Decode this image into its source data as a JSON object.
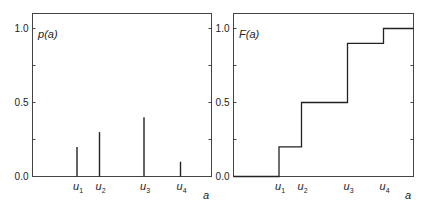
{
  "chart_data": [
    {
      "type": "bar",
      "subtype": "stem",
      "title": "",
      "function_label": "p(a)",
      "xlabel": "a",
      "ylabel": "",
      "ylim": [
        0,
        1.0
      ],
      "yticks": [
        "0.0",
        "0.5",
        "1.0"
      ],
      "categories": [
        "u1",
        "u2",
        "u3",
        "u4"
      ],
      "values": [
        0.2,
        0.3,
        0.4,
        0.1
      ],
      "grid": false
    },
    {
      "type": "line",
      "subtype": "step",
      "title": "",
      "function_label": "F(a)",
      "xlabel": "a",
      "ylabel": "",
      "ylim": [
        0,
        1.0
      ],
      "yticks": [
        "0.0",
        "0.5",
        "1.0"
      ],
      "categories": [
        "u1",
        "u2",
        "u3",
        "u4"
      ],
      "values": [
        0.2,
        0.5,
        0.9,
        1.0
      ],
      "grid": false
    }
  ],
  "left": {
    "label_main": "p",
    "label_arg": "(a)",
    "yticks": [
      "1.0",
      "0.5",
      "0.0"
    ],
    "xticks": [
      {
        "base": "u",
        "sub": "1"
      },
      {
        "base": "u",
        "sub": "2"
      },
      {
        "base": "u",
        "sub": "3"
      },
      {
        "base": "u",
        "sub": "4"
      }
    ],
    "xlabel": "a"
  },
  "right": {
    "label_main": "F",
    "label_arg": "(a)",
    "yticks": [
      "1.0",
      "0.5",
      "0.0"
    ],
    "xticks": [
      {
        "base": "u",
        "sub": "1"
      },
      {
        "base": "u",
        "sub": "2"
      },
      {
        "base": "u",
        "sub": "3"
      },
      {
        "base": "u",
        "sub": "4"
      }
    ],
    "xlabel": "a"
  }
}
